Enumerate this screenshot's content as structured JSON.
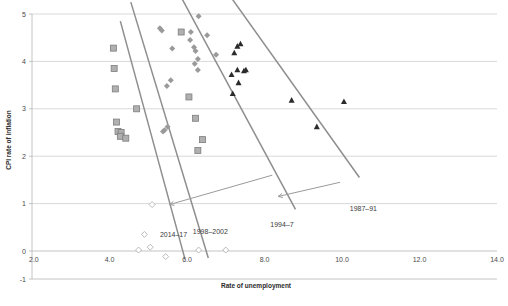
{
  "chart_data": {
    "type": "scatter",
    "title": "",
    "xlabel": "Rate of unemployment",
    "ylabel": "CPI rate of inflation",
    "xlim": [
      2.0,
      14.0
    ],
    "ylim": [
      -1,
      5
    ],
    "xticks": [
      "2.0",
      "4.0",
      "6.0",
      "8.0",
      "10.0",
      "12.0",
      "14.0"
    ],
    "xtick_values": [
      2.0,
      4.0,
      6.0,
      8.0,
      10.0,
      12.0,
      14.0
    ],
    "yticks": [
      "-1",
      "0",
      "1",
      "2",
      "3",
      "4",
      "5"
    ],
    "ytick_values": [
      -1,
      0,
      1,
      2,
      3,
      4,
      5
    ],
    "grid": "horizontal",
    "legend": "inline-annotations",
    "series": [
      {
        "name": "1987–91",
        "marker": "triangle",
        "color": "#2b2b2b",
        "points": [
          [
            7.3,
            4.32
          ],
          [
            7.38,
            4.37
          ],
          [
            7.22,
            4.18
          ],
          [
            7.3,
            3.82
          ],
          [
            7.47,
            3.8
          ],
          [
            7.52,
            3.82
          ],
          [
            7.15,
            3.72
          ],
          [
            7.33,
            3.55
          ],
          [
            7.18,
            3.32
          ],
          [
            8.7,
            3.18
          ],
          [
            10.05,
            3.15
          ],
          [
            9.35,
            2.62
          ]
        ]
      },
      {
        "name": "1994–7",
        "marker": "diamond-filled",
        "color": "#9a9a9a",
        "points": [
          [
            6.3,
            4.95
          ],
          [
            6.52,
            4.55
          ],
          [
            6.1,
            4.62
          ],
          [
            6.08,
            4.45
          ],
          [
            6.18,
            4.3
          ],
          [
            6.22,
            4.22
          ],
          [
            6.75,
            4.14
          ],
          [
            6.28,
            4.05
          ],
          [
            6.2,
            3.95
          ],
          [
            6.28,
            3.82
          ],
          [
            5.62,
            4.27
          ],
          [
            5.35,
            4.65
          ],
          [
            5.3,
            4.7
          ],
          [
            5.58,
            3.6
          ],
          [
            5.48,
            3.48
          ],
          [
            5.5,
            2.62
          ],
          [
            5.42,
            2.55
          ],
          [
            5.38,
            2.52
          ]
        ]
      },
      {
        "name": "1998–2002",
        "marker": "square",
        "color": "#b0b0b0",
        "points": [
          [
            4.1,
            4.28
          ],
          [
            4.12,
            3.85
          ],
          [
            4.15,
            3.42
          ],
          [
            4.7,
            3.0
          ],
          [
            4.18,
            2.72
          ],
          [
            4.22,
            2.52
          ],
          [
            4.3,
            2.5
          ],
          [
            4.28,
            2.42
          ],
          [
            4.42,
            2.38
          ],
          [
            5.85,
            4.62
          ],
          [
            6.05,
            3.25
          ],
          [
            6.22,
            2.8
          ],
          [
            6.4,
            2.35
          ],
          [
            6.28,
            2.12
          ]
        ]
      },
      {
        "name": "2014–17",
        "marker": "diamond-open",
        "color": "#ffffff",
        "points": [
          [
            5.1,
            0.98
          ],
          [
            4.9,
            0.35
          ],
          [
            5.05,
            0.08
          ],
          [
            4.75,
            0.02
          ],
          [
            6.3,
            0.02
          ],
          [
            7.0,
            0.02
          ],
          [
            5.45,
            -0.2
          ]
        ]
      }
    ],
    "trendlines": [
      {
        "name": "1987–91",
        "x1": 7.05,
        "y1": 5.45,
        "x2": 10.45,
        "y2": 1.55
      },
      {
        "name": "1994–7",
        "x1": 5.82,
        "y1": 5.4,
        "x2": 8.8,
        "y2": 0.88
      },
      {
        "name": "1998–2002",
        "x1": 4.55,
        "y1": 5.25,
        "x2": 6.55,
        "y2": -0.25
      },
      {
        "name": "2014–17",
        "x1": 4.28,
        "y1": 4.85,
        "x2": 5.95,
        "y2": -0.3
      }
    ],
    "annotations": [
      {
        "label": "2014–17",
        "x": 5.3,
        "y": 0.3
      },
      {
        "label": "1998–2002",
        "x": 6.15,
        "y": 0.35
      },
      {
        "label": "1994–7",
        "x": 8.15,
        "y": 0.5
      },
      {
        "label": "1987–91",
        "x": 10.2,
        "y": 0.85
      }
    ],
    "leaders": [
      {
        "from_x": 9.95,
        "from_y": 1.45,
        "to_x": 8.35,
        "to_y": 1.15
      },
      {
        "from_x": 8.2,
        "from_y": 1.6,
        "to_x": 5.55,
        "to_y": 0.98
      }
    ]
  }
}
